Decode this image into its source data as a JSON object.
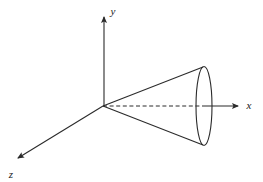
{
  "figure": {
    "name": "cone-3d-coordinate-diagram",
    "background_color": "#ffffff",
    "line_color": "#2b2b2b",
    "width": 263,
    "height": 182
  },
  "axes": {
    "origin": {
      "x": 103,
      "y": 106
    },
    "x_axis": {
      "label": "x",
      "label_x": 249,
      "label_y": 109,
      "tip_x": 243,
      "tip_y": 106,
      "dashed_from_x": 103,
      "dashed_to_x": 204,
      "solid_from_x": 204,
      "solid_to_x": 238
    },
    "y_axis": {
      "label": "y",
      "label_x": 112,
      "label_y": 15,
      "tip_x": 104,
      "tip_y": 12,
      "base_x": 104,
      "base_y": 106
    },
    "z_axis": {
      "label": "z",
      "label_x": 7,
      "label_y": 178,
      "tip_x": 13,
      "tip_y": 161,
      "base_x": 103,
      "base_y": 106
    }
  },
  "cone": {
    "apex": {
      "x": 103,
      "y": 106
    },
    "upper_edge_end": {
      "x": 203,
      "y": 67
    },
    "lower_edge_end": {
      "x": 203,
      "y": 145
    },
    "base_ellipse": {
      "center_x": 204,
      "center_y": 106,
      "radius_x": 8,
      "radius_y": 39.5
    }
  }
}
